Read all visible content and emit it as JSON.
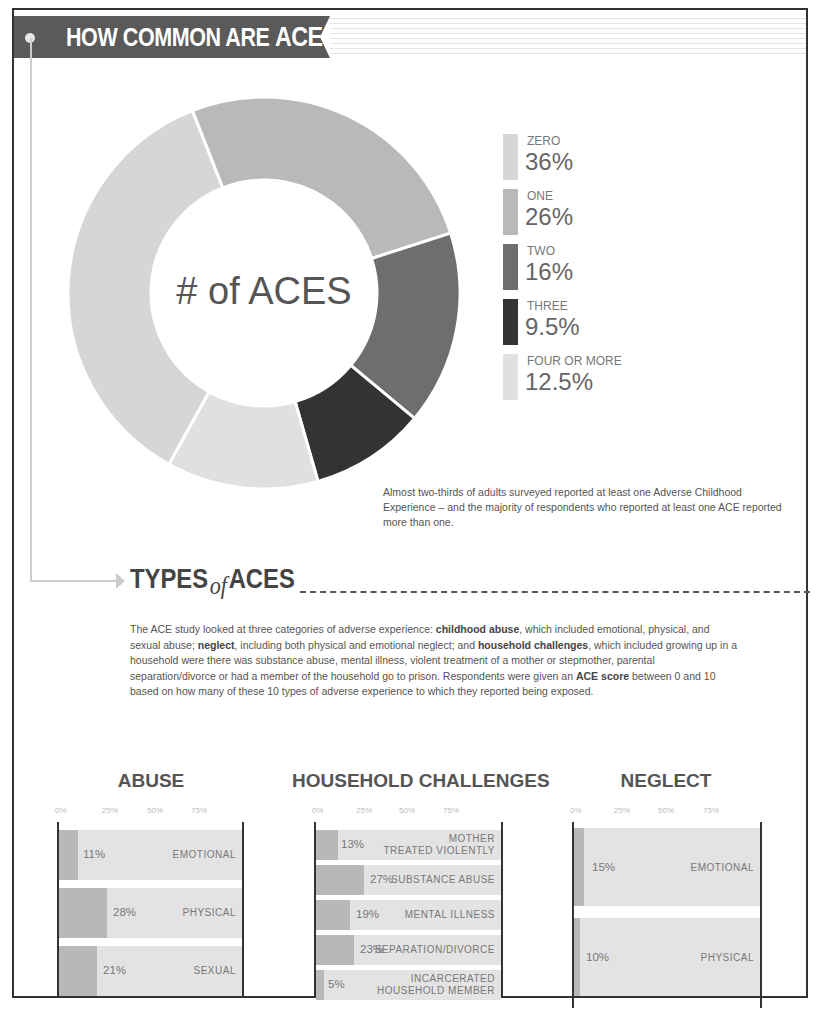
{
  "header": {
    "title_prefix": "HOW COMMON ARE ",
    "title_emph": "ACES?"
  },
  "donut": {
    "center_label": "# of ACES",
    "segments": [
      {
        "name": "ZERO",
        "value": "36%",
        "color": "#d6d6d6"
      },
      {
        "name": "ONE",
        "value": "26%",
        "color": "#b9b9b9"
      },
      {
        "name": "TWO",
        "value": "16%",
        "color": "#6e6e6e"
      },
      {
        "name": "THREE",
        "value": "9.5%",
        "color": "#333333"
      },
      {
        "name": "FOUR OR MORE",
        "value": "12.5%",
        "color": "#e0e0e0"
      }
    ]
  },
  "caption": "Almost two-thirds of adults surveyed reported at least one Adverse Childhood Experience – and the majority of respondents who reported at least one ACE reported more than one.",
  "types": {
    "title_a": "TYPES",
    "title_of": "of",
    "title_b": "ACES",
    "body": {
      "p1": "The ACE study looked at three categories of adverse experience: ",
      "b1": "childhood abuse",
      "p2": ", which included emotional, physical, and sexual abuse; ",
      "b2": "neglect",
      "p3": ", including both physical and emotional neglect; and ",
      "b3": "household challenges",
      "p4": ", which included growing up in a household were there was substance abuse, mental illness, violent treatment of a mother or stepmother, parental separation/divorce or had a member of the household go to prison. Respondents were given an ",
      "b4": "ACE score",
      "p5": " between 0 and 10 based on how many of these 10 types of adverse experience to which they reported being exposed."
    }
  },
  "ticks": [
    "0%",
    "25%",
    "50%",
    "75%"
  ],
  "panels": {
    "abuse": {
      "title": "ABUSE",
      "bars": [
        {
          "pct": "11%",
          "label1": "EMOTIONAL",
          "label2": ""
        },
        {
          "pct": "28%",
          "label1": "PHYSICAL",
          "label2": ""
        },
        {
          "pct": "21%",
          "label1": "SEXUAL",
          "label2": ""
        }
      ]
    },
    "household": {
      "title": "HOUSEHOLD CHALLENGES",
      "bars": [
        {
          "pct": "13%",
          "label1": "MOTHER",
          "label2": "TREATED VIOLENTLY"
        },
        {
          "pct": "27%",
          "label1": "SUBSTANCE ABUSE",
          "label2": ""
        },
        {
          "pct": "19%",
          "label1": "MENTAL ILLNESS",
          "label2": ""
        },
        {
          "pct": "23%",
          "label1": "SEPARATION/DIVORCE",
          "label2": ""
        },
        {
          "pct": "5%",
          "label1": "INCARCERATED",
          "label2": "HOUSEHOLD MEMBER"
        }
      ]
    },
    "neglect": {
      "title": "NEGLECT",
      "bars": [
        {
          "pct": "15%",
          "label1": "EMOTIONAL",
          "label2": ""
        },
        {
          "pct": "10%",
          "label1": "PHYSICAL",
          "label2": ""
        }
      ]
    }
  },
  "chart_data": [
    {
      "type": "pie",
      "title": "HOW COMMON ARE ACES?",
      "subtitle": "# of ACES",
      "categories": [
        "ZERO",
        "ONE",
        "TWO",
        "THREE",
        "FOUR OR MORE"
      ],
      "values": [
        36,
        26,
        16,
        9.5,
        12.5
      ],
      "legend_position": "right",
      "donut": true
    },
    {
      "type": "bar",
      "title": "ABUSE",
      "orientation": "horizontal",
      "categories": [
        "EMOTIONAL",
        "PHYSICAL",
        "SEXUAL"
      ],
      "values": [
        11,
        28,
        21
      ],
      "xticks": [
        "0%",
        "25%",
        "50%",
        "75%"
      ]
    },
    {
      "type": "bar",
      "title": "HOUSEHOLD CHALLENGES",
      "orientation": "horizontal",
      "categories": [
        "MOTHER TREATED VIOLENTLY",
        "SUBSTANCE ABUSE",
        "MENTAL ILLNESS",
        "SEPARATION/DIVORCE",
        "INCARCERATED HOUSEHOLD MEMBER"
      ],
      "values": [
        13,
        27,
        19,
        23,
        5
      ],
      "xticks": [
        "0%",
        "25%",
        "50%",
        "75%"
      ]
    },
    {
      "type": "bar",
      "title": "NEGLECT",
      "orientation": "horizontal",
      "categories": [
        "EMOTIONAL",
        "PHYSICAL"
      ],
      "values": [
        15,
        10
      ],
      "xticks": [
        "0%",
        "25%",
        "50%",
        "75%"
      ]
    }
  ]
}
